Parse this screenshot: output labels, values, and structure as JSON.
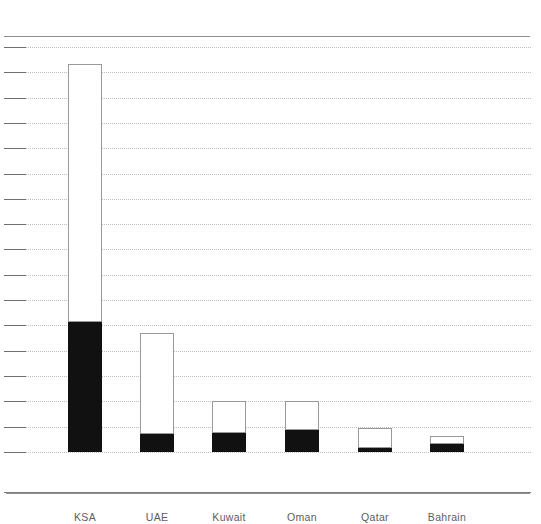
{
  "chart_data": {
    "type": "bar",
    "subtype": "stacked-vertical",
    "title": "",
    "subtitle": "",
    "xlabel": "",
    "ylabel": "",
    "categories": [
      "KSA",
      "UAE",
      "Kuwait",
      "Oman",
      "Qatar",
      "Bahrain"
    ],
    "series": [
      {
        "name": "black-segment",
        "color": "#111111",
        "position": "bottom",
        "values": [
          130,
          18,
          19,
          22,
          4,
          8
        ]
      },
      {
        "name": "white-segment",
        "color": "#ffffff",
        "position": "top",
        "values": [
          258,
          101,
          32,
          29,
          20,
          8
        ]
      }
    ],
    "totals": [
      388,
      119,
      51,
      51,
      24,
      16
    ],
    "ylim": [
      0,
      405
    ],
    "y_tick_count": 17,
    "grid": true,
    "grid_style": "dotted-horizontal",
    "legend": "none",
    "axis_tick_marks_left": true
  },
  "axis": {
    "gridlines": [
      47.0,
      72.3,
      97.6,
      122.9,
      148.2,
      173.5,
      198.8,
      224.1,
      249.4,
      274.7,
      300.0,
      325.3,
      350.6,
      375.9,
      401.2,
      426.5,
      451.8
    ],
    "baseline_y": 452
  },
  "bars": [
    {
      "label": "KSA",
      "x": 68,
      "width": 34,
      "top": 64,
      "split": 322,
      "bottom": 452
    },
    {
      "label": "UAE",
      "x": 140,
      "width": 34,
      "top": 333,
      "split": 434,
      "bottom": 452
    },
    {
      "label": "Kuwait",
      "x": 212,
      "width": 34,
      "top": 401,
      "split": 433,
      "bottom": 452
    },
    {
      "label": "Oman",
      "x": 285,
      "width": 34,
      "top": 401,
      "split": 430,
      "bottom": 452
    },
    {
      "label": "Qatar",
      "x": 358,
      "width": 34,
      "top": 428,
      "split": 448,
      "bottom": 452
    },
    {
      "label": "Bahrain",
      "x": 430,
      "width": 34,
      "top": 436,
      "split": 444,
      "bottom": 452
    }
  ],
  "style": {
    "background": "#ffffff",
    "rule_color": "#8e8e8e",
    "grid_color": "#bfbfbf",
    "tick_color": "#6f6f6f",
    "label_color": "#5d5d5d",
    "segment_black": "#111111",
    "segment_white": "#ffffff",
    "segment_outline": "#9a9a9a"
  }
}
